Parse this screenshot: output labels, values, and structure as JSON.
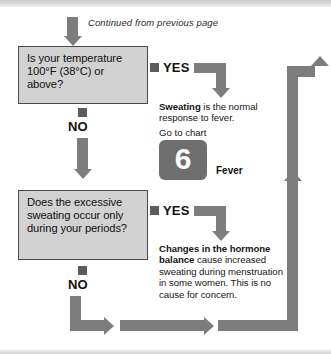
{
  "page": {
    "header_note": "Continued from previous page"
  },
  "nodes": {
    "q1": {
      "text": "Is your temperature 100°F (38°C) or above?"
    },
    "q2": {
      "text": "Does the excessive sweating occur only during your periods?"
    }
  },
  "answers": {
    "q1_yes": "YES",
    "q1_no": "NO",
    "q2_yes": "YES",
    "q2_no": "NO"
  },
  "outcomes": {
    "fever": {
      "lead": "Sweating",
      "body": " is the normal response to fever.",
      "goto_label": "Go to chart",
      "chart_number": "6",
      "chart_name": "Fever"
    },
    "hormone": {
      "lead": "Changes in the hormone balance",
      "body": " cause increased sweating during menstruation in some women. This is no cause for concern."
    }
  },
  "colors": {
    "arrow": "#7d7d7d",
    "box_fill": "#d2d2d2",
    "box_border": "#4a4a4a",
    "tile": "#6e6e6e",
    "marker": "#5c5c5c"
  }
}
